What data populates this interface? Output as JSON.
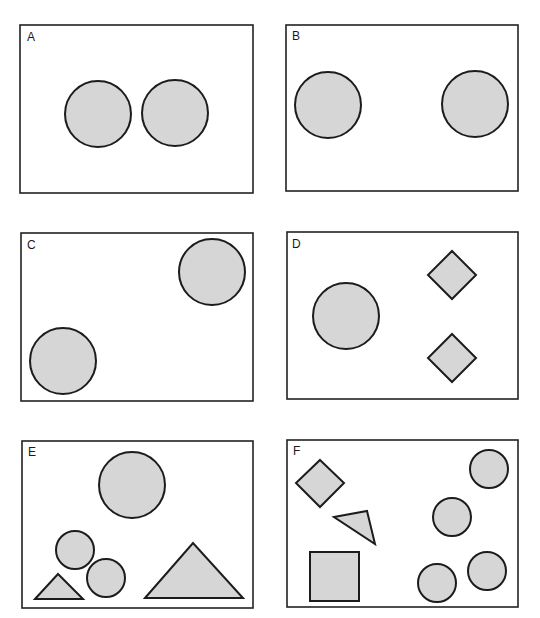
{
  "figure": {
    "colors": {
      "shape_fill": "#d6d6d6",
      "stroke": "#1c1c1c",
      "background": "#ffffff"
    },
    "panels": [
      {
        "label": "A",
        "shapes": [
          "circle",
          "circle"
        ]
      },
      {
        "label": "B",
        "shapes": [
          "circle",
          "circle"
        ]
      },
      {
        "label": "C",
        "shapes": [
          "circle",
          "circle"
        ]
      },
      {
        "label": "D",
        "shapes": [
          "circle",
          "diamond",
          "diamond"
        ]
      },
      {
        "label": "E",
        "shapes": [
          "circle",
          "circle",
          "circle",
          "triangle",
          "triangle"
        ]
      },
      {
        "label": "F",
        "shapes": [
          "diamond",
          "triangle",
          "square",
          "circle",
          "circle",
          "circle",
          "circle"
        ]
      }
    ]
  }
}
